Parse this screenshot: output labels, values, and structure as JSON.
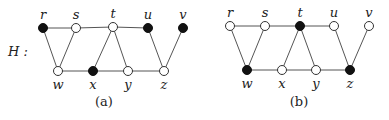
{
  "figure": {
    "graph_name": "H :",
    "node_radius": 4.5,
    "edges": [
      [
        "r",
        "s"
      ],
      [
        "s",
        "t"
      ],
      [
        "t",
        "u"
      ],
      [
        "r",
        "w"
      ],
      [
        "s",
        "w"
      ],
      [
        "w",
        "x"
      ],
      [
        "x",
        "y"
      ],
      [
        "y",
        "z"
      ],
      [
        "t",
        "x"
      ],
      [
        "t",
        "y"
      ],
      [
        "u",
        "z"
      ],
      [
        "v",
        "z"
      ]
    ],
    "panels": [
      {
        "caption": "(a)",
        "caption_pos": [
          104,
          106
        ],
        "nodes": {
          "r": {
            "label": "r",
            "x": 43,
            "y": 28,
            "filled": true,
            "label_side": "top"
          },
          "s": {
            "label": "s",
            "x": 76,
            "y": 28,
            "filled": false,
            "label_side": "top"
          },
          "t": {
            "label": "t",
            "x": 113,
            "y": 27,
            "filled": false,
            "label_side": "top"
          },
          "u": {
            "label": "u",
            "x": 148,
            "y": 28,
            "filled": true,
            "label_side": "top"
          },
          "v": {
            "label": "v",
            "x": 183,
            "y": 28,
            "filled": true,
            "label_side": "top"
          },
          "w": {
            "label": "w",
            "x": 58,
            "y": 71,
            "filled": false,
            "label_side": "bottom"
          },
          "x": {
            "label": "x",
            "x": 93,
            "y": 71,
            "filled": true,
            "label_side": "bottom"
          },
          "y": {
            "label": "y",
            "x": 128,
            "y": 71,
            "filled": false,
            "label_side": "bottom"
          },
          "z": {
            "label": "z",
            "x": 164,
            "y": 71,
            "filled": false,
            "label_side": "bottom"
          }
        }
      },
      {
        "caption": "(b)",
        "caption_pos": [
          299,
          106
        ],
        "nodes": {
          "r": {
            "label": "r",
            "x": 230,
            "y": 26,
            "filled": false,
            "label_side": "top"
          },
          "s": {
            "label": "s",
            "x": 265,
            "y": 26,
            "filled": false,
            "label_side": "top"
          },
          "t": {
            "label": "t",
            "x": 300,
            "y": 26,
            "filled": true,
            "label_side": "top"
          },
          "u": {
            "label": "u",
            "x": 334,
            "y": 26,
            "filled": false,
            "label_side": "top"
          },
          "v": {
            "label": "v",
            "x": 369,
            "y": 26,
            "filled": false,
            "label_side": "top"
          },
          "w": {
            "label": "w",
            "x": 247,
            "y": 70,
            "filled": true,
            "label_side": "bottom"
          },
          "x": {
            "label": "x",
            "x": 282,
            "y": 70,
            "filled": false,
            "label_side": "bottom"
          },
          "y": {
            "label": "y",
            "x": 316,
            "y": 70,
            "filled": false,
            "label_side": "bottom"
          },
          "z": {
            "label": "z",
            "x": 350,
            "y": 70,
            "filled": true,
            "label_side": "bottom"
          }
        }
      }
    ]
  }
}
